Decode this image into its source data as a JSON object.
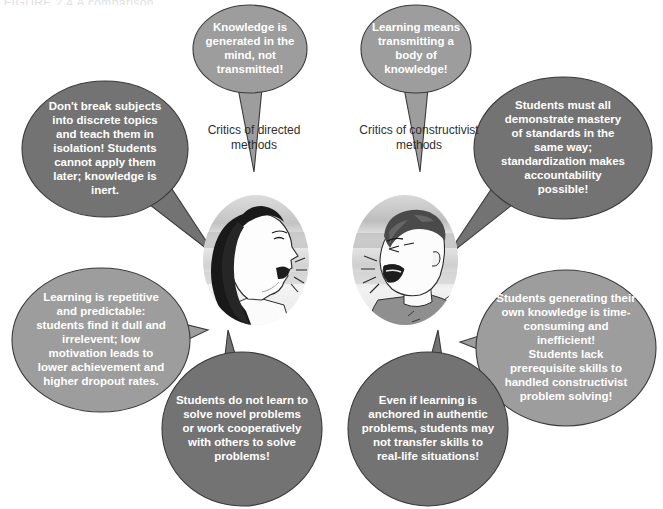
{
  "figure": {
    "cropped_header": "FIGURE 2.4  A comparison",
    "background_color": "#ffffff",
    "bubble_fill_light": "#9d9d9d",
    "bubble_fill_dark": "#737373",
    "bubble_stroke": "#3a3a3a",
    "bubble_text_color": "#ffffff",
    "label_text_color": "#2f2f2f"
  },
  "center_labels": [
    {
      "id": "critics-of-directed-methods",
      "lines": [
        "Critics of directed",
        "methods"
      ]
    },
    {
      "id": "critics-of-constructivist-methods",
      "lines": [
        "Critics of constructivist",
        "methods"
      ]
    }
  ],
  "portraits": [
    {
      "id": "woman-shouting",
      "alt": "Woman in profile shouting toward the right"
    },
    {
      "id": "man-shouting",
      "alt": "Man shouting toward the left"
    }
  ],
  "bubbles": [
    {
      "id": "knowledge-generated",
      "group": "directed-critics",
      "shade": "light",
      "font_size": 11.5,
      "lines": [
        "Knowledge is",
        "generated in the",
        "mind, not",
        "transmitted!"
      ]
    },
    {
      "id": "learning-means-transmitting",
      "group": "constructivist-critics",
      "shade": "light",
      "font_size": 11.5,
      "lines": [
        "Learning means",
        "transmitting a",
        "body of",
        "knowledge!"
      ]
    },
    {
      "id": "dont-break-subjects",
      "group": "directed-critics",
      "shade": "dark",
      "font_size": 11.5,
      "lines": [
        "Don't break subjects",
        "into discrete topics",
        "and teach them in",
        "isolation! Students",
        "cannot apply them",
        "later; knowledge is",
        "inert."
      ]
    },
    {
      "id": "students-must-demonstrate-mastery",
      "group": "constructivist-critics",
      "shade": "dark",
      "font_size": 11.5,
      "lines": [
        "Students must all",
        "demonstrate mastery",
        "of standards in the",
        "same way;",
        "standardization makes",
        "accountability",
        "possible!"
      ]
    },
    {
      "id": "learning-is-repetitive",
      "group": "directed-critics",
      "shade": "light",
      "font_size": 11.5,
      "lines": [
        "Learning is repetitive",
        "and predictable:",
        "students find it dull and",
        "irrelevent; low",
        "motivation leads to",
        "lower achievement and",
        "higher dropout rates."
      ]
    },
    {
      "id": "students-generating-own-knowledge",
      "group": "constructivist-critics",
      "shade": "light",
      "font_size": 11.5,
      "lines": [
        "Students generating their",
        "own knowledge is time-",
        "consuming and",
        "inefficient!",
        "Students lack",
        "prerequisite skills to",
        "handled constructivist",
        "problem solving!"
      ]
    },
    {
      "id": "students-do-not-learn-novel-problems",
      "group": "directed-critics",
      "shade": "dark",
      "font_size": 11.5,
      "lines": [
        "Students do not learn to",
        "solve novel problems",
        "or work cooperatively",
        "with others to solve",
        "problems!"
      ]
    },
    {
      "id": "even-if-learning-anchored",
      "group": "constructivist-critics",
      "shade": "dark",
      "font_size": 11.5,
      "lines": [
        "Even if learning is",
        "anchored in authentic",
        "problems, students may",
        "not transfer skills to",
        "real-life situations!"
      ]
    }
  ]
}
